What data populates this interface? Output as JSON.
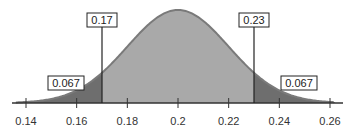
{
  "chart_data": {
    "type": "area",
    "title": "",
    "xlabel": "",
    "ylabel": "",
    "distribution": "normal",
    "mean": 0.2,
    "sd": 0.02,
    "xlim": [
      0.135,
      0.265
    ],
    "x_ticks": [
      "0.14",
      "0.16",
      "0.18",
      "0.2",
      "0.22",
      "0.24",
      "0.26"
    ],
    "x_tick_values": [
      0.14,
      0.16,
      0.18,
      0.2,
      0.22,
      0.24,
      0.26
    ],
    "cutoffs": [
      {
        "value": 0.17,
        "label": "0.17"
      },
      {
        "value": 0.23,
        "label": "0.23"
      }
    ],
    "tail_areas": [
      {
        "side": "left",
        "label": "0.067",
        "value": 0.067
      },
      {
        "side": "right",
        "label": "0.067",
        "value": 0.067
      }
    ],
    "colors": {
      "center_fill": "#a9a9a9",
      "tail_fill": "#6e6e6e",
      "curve": "#7a7a7a",
      "axis": "#333333"
    },
    "grid": false
  }
}
